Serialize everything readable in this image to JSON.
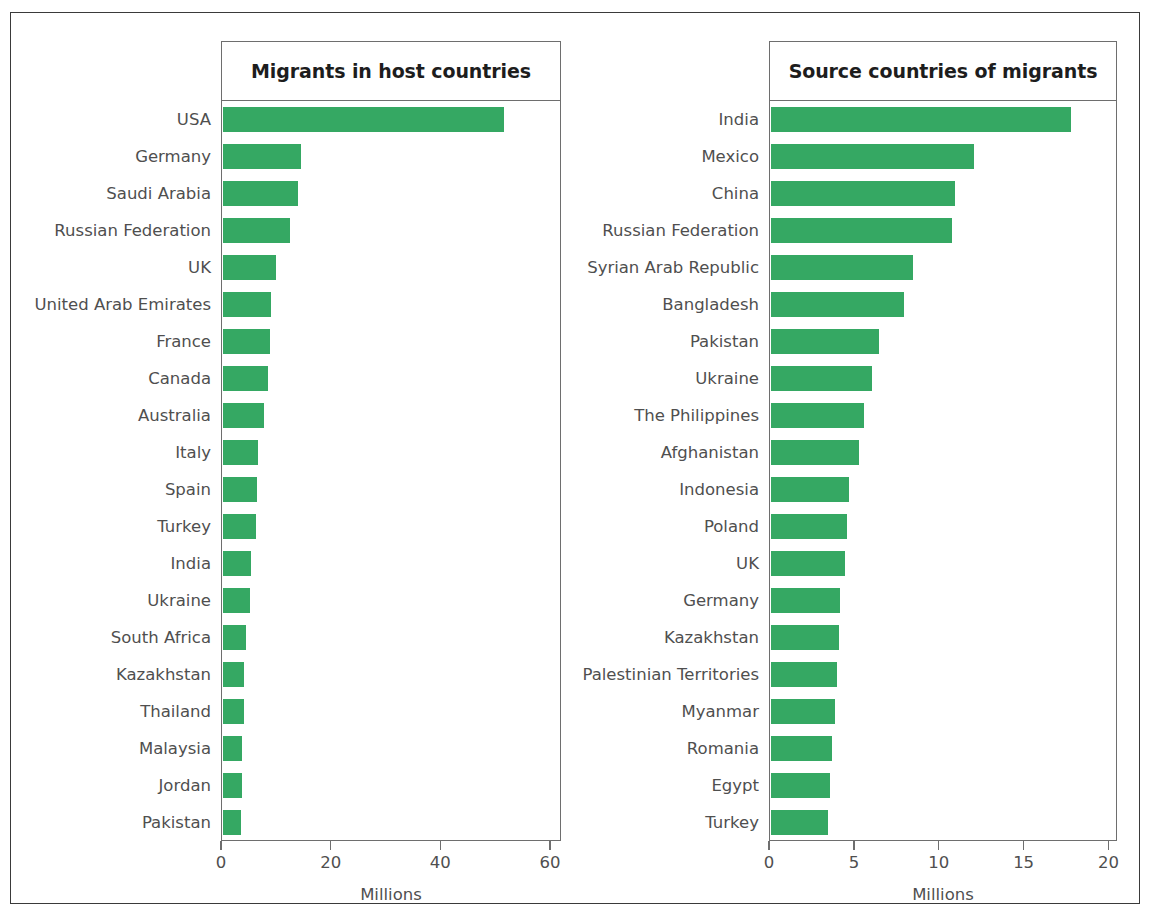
{
  "chart_data": [
    {
      "type": "bar",
      "orientation": "horizontal",
      "title": "Migrants in host countries",
      "xlabel": "Millions",
      "ylabel": "",
      "xlim": [
        0,
        62
      ],
      "xticks": [
        0,
        20,
        40,
        60
      ],
      "xtick_labels": [
        "0",
        "20",
        "40",
        "60"
      ],
      "grid": false,
      "legend": "none",
      "bar_color": "#35a863",
      "categories": [
        "USA",
        "Germany",
        "Saudi Arabia",
        "Russian Federation",
        "UK",
        "United Arab Emirates",
        "France",
        "Canada",
        "Australia",
        "Italy",
        "Spain",
        "Turkey",
        "India",
        "Ukraine",
        "South Africa",
        "Kazakhstan",
        "Thailand",
        "Malaysia",
        "Jordan",
        "Pakistan"
      ],
      "values": [
        51.5,
        14.3,
        13.8,
        12.2,
        9.7,
        8.8,
        8.6,
        8.2,
        7.5,
        6.5,
        6.2,
        6.0,
        5.2,
        5.0,
        4.3,
        3.8,
        3.8,
        3.5,
        3.4,
        3.3
      ]
    },
    {
      "type": "bar",
      "orientation": "horizontal",
      "title": "Source countries of migrants",
      "xlabel": "Millions",
      "ylabel": "",
      "xlim": [
        0,
        20.5
      ],
      "xticks": [
        0,
        5,
        10,
        15,
        20
      ],
      "xtick_labels": [
        "0",
        "5",
        "10",
        "15",
        "20"
      ],
      "grid": false,
      "legend": "none",
      "bar_color": "#35a863",
      "categories": [
        "India",
        "Mexico",
        "China",
        "Russian Federation",
        "Syrian Arab Republic",
        "Bangladesh",
        "Pakistan",
        "Ukraine",
        "The Philippines",
        "Afghanistan",
        "Indonesia",
        "Poland",
        "UK",
        "Germany",
        "Kazakhstan",
        "Palestinian Territories",
        "Myanmar",
        "Romania",
        "Egypt",
        "Turkey"
      ],
      "values": [
        17.8,
        12.0,
        10.9,
        10.7,
        8.4,
        7.9,
        6.4,
        6.0,
        5.5,
        5.2,
        4.6,
        4.5,
        4.4,
        4.1,
        4.0,
        3.9,
        3.8,
        3.6,
        3.5,
        3.4
      ]
    }
  ],
  "panels": {
    "left": {
      "title": "Migrants in host countries",
      "axis_title": "Millions"
    },
    "right": {
      "title": "Source countries of migrants",
      "axis_title": "Millions"
    }
  }
}
